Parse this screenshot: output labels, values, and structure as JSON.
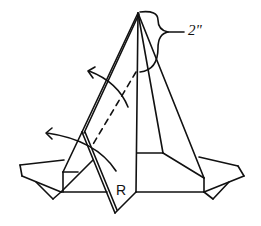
{
  "diagram": {
    "type": "origami-fold-step",
    "labels": {
      "measurement": "2\"",
      "flap_label": "R"
    },
    "annotations": [
      {
        "kind": "brace",
        "meaning": "distance from apex",
        "value": "2\""
      },
      {
        "kind": "valley-fold-line",
        "style": "dashed"
      },
      {
        "kind": "fold-arrow",
        "direction": "left-up",
        "count": 2
      }
    ]
  }
}
